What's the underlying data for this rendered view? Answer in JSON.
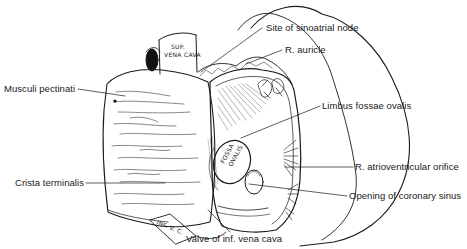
{
  "figure": {
    "labels": [
      {
        "id": "site-sinoatrial-node",
        "text": "Site of sinoatrial node"
      },
      {
        "id": "r-auricle",
        "text": "R. auricle"
      },
      {
        "id": "musculi-pectinati",
        "text": "Musculi pectinati"
      },
      {
        "id": "limbus-fossae-ovalis",
        "text": "Limbus fossae ovalis"
      },
      {
        "id": "crista-terminalis",
        "text": "Crista terminalis"
      },
      {
        "id": "r-atrioventricular-orifice",
        "text": "R. atrioventricular orifice"
      },
      {
        "id": "opening-coronary-sinus",
        "text": "Opening of coronary sinus"
      },
      {
        "id": "valve-inf-vena-cava",
        "text": "Valve of inf. vena cava"
      }
    ],
    "inline_labels": {
      "sup_vena_cava_line1": "SUP.",
      "sup_vena_cava_line2": "VENA CAVA",
      "fossa_ovalis_line1": "FOSSA",
      "fossa_ovalis_line2": "OVALIS",
      "inf_vena_cava": "INF. V. C."
    },
    "colors": {
      "ink": "#1a1a1a",
      "background": "#ffffff"
    }
  }
}
